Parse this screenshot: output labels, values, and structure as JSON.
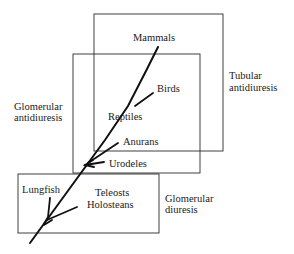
{
  "diagram": {
    "type": "phylogeny-with-overlapping-regions",
    "regions": [
      {
        "id": "tubular",
        "label_line1": "Tubular",
        "label_line2": "antidiuresis"
      },
      {
        "id": "glomerular-antidiuresis",
        "label_line1": "Glomerular",
        "label_line2": "antidiuresis"
      },
      {
        "id": "glomerular-diuresis",
        "label_line1": "Glomerular",
        "label_line2": "diuresis"
      }
    ],
    "taxa": {
      "mammals": "Mammals",
      "birds": "Birds",
      "reptiles": "Reptiles",
      "anurans": "Anurans",
      "urodeles": "Urodeles",
      "lungfish": "Lungfish",
      "teleosts": "Teleosts",
      "holosteans": "Holosteans"
    },
    "colors": {
      "line": "#111111",
      "background": "#ffffff"
    }
  }
}
